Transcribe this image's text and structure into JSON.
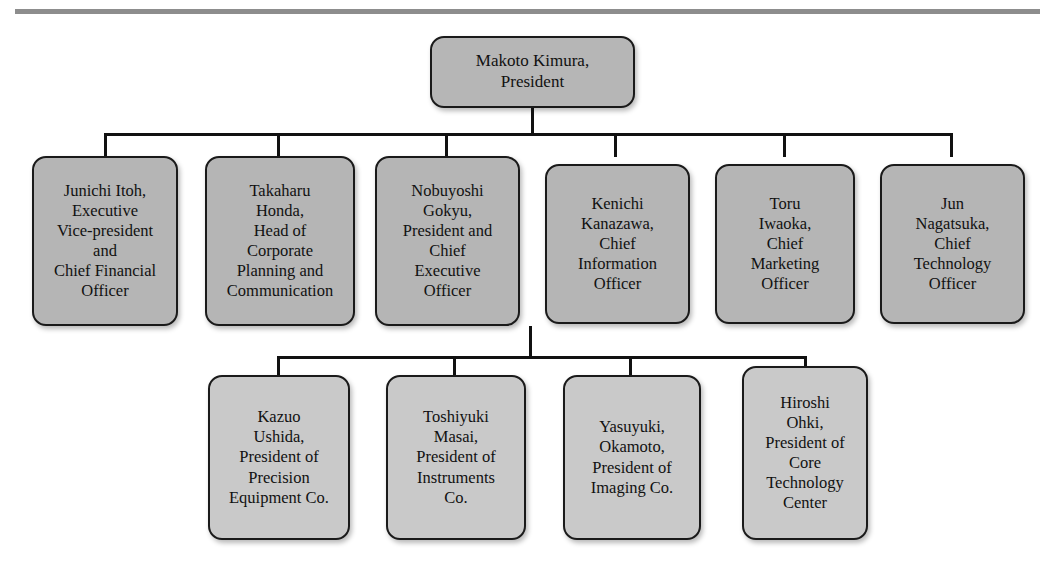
{
  "document": {
    "title": "Nikon Corporation Organizational Chart",
    "top_rule_color": "#8d8d8d",
    "line_color": "#111111"
  },
  "org_chart": {
    "root": {
      "name": "Makoto Kimura,",
      "title": "President",
      "text": "Makoto Kimura,\nPresident",
      "fill": "#b6b6b6"
    },
    "executives": [
      {
        "name": "Junichi Itoh,",
        "title": "Executive Vice-president and Chief Financial Officer",
        "text": "Junichi Itoh,\nExecutive\nVice-president\nand\nChief Financial\nOfficer",
        "fill": "#b5b5b5"
      },
      {
        "name": "Takaharu Honda,",
        "title": "Head of Corporate Planning and Communication",
        "text": "Takaharu\nHonda,\nHead of\nCorporate\nPlanning and\nCommunication",
        "fill": "#b5b5b5"
      },
      {
        "name": "Nobuyoshi Gokyu,",
        "title": "President and Chief Executive Officer",
        "text": "Nobuyoshi\nGokyu,\nPresident and\nChief\nExecutive\nOfficer",
        "fill": "#b5b5b5"
      },
      {
        "name": "Kenichi Kanazawa,",
        "title": "Chief Information Officer",
        "text": "Kenichi\nKanazawa,\nChief\nInformation\nOfficer",
        "fill": "#b5b5b5"
      },
      {
        "name": "Toru Iwaoka,",
        "title": "Chief Marketing Officer",
        "text": "Toru\nIwaoka,\nChief\nMarketing\nOfficer",
        "fill": "#b5b5b5"
      },
      {
        "name": "Jun Nagatsuka,",
        "title": "Chief Technology Officer",
        "text": "Jun\nNagatsuka,\nChief\nTechnology\nOfficer",
        "fill": "#b5b5b5"
      }
    ],
    "business_units": [
      {
        "name": "Kazuo Ushida,",
        "title": "President of Precision Equipment Co.",
        "text": "Kazuo\nUshida,\nPresident of\nPrecision\nEquipment Co.",
        "fill": "#c9c9c9"
      },
      {
        "name": "Toshiyuki Masai,",
        "title": "President of Instruments Co.",
        "text": "Toshiyuki\nMasai,\nPresident of\nInstruments\nCo.",
        "fill": "#c9c9c9"
      },
      {
        "name": "Yasuyuki, Okamoto,",
        "title": "President of Imaging Co.",
        "text": "Yasuyuki,\nOkamoto,\nPresident of\nImaging Co.",
        "fill": "#c9c9c9"
      },
      {
        "name": "Hiroshi Ohki,",
        "title": "President of Core Technology Center",
        "text": "Hiroshi\nOhki,\nPresident of\nCore\nTechnology\nCenter",
        "fill": "#c9c9c9"
      }
    ]
  }
}
